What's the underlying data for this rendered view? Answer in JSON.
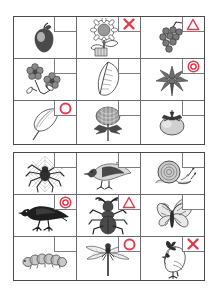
{
  "worksheet": {
    "title": "Nature picture grid worksheet",
    "grids": [
      {
        "name": "plants-grid",
        "rows": [
          [
            {
              "item": "apple",
              "label": "Apple",
              "mark": "none"
            },
            {
              "item": "sunflower",
              "label": "Sunflower",
              "mark": "x"
            },
            {
              "item": "grapes",
              "label": "Grapes",
              "mark": "triangle"
            }
          ],
          [
            {
              "item": "flower-cluster",
              "label": "Flower cluster",
              "mark": "none"
            },
            {
              "item": "leaf",
              "label": "Leaf",
              "mark": "none"
            },
            {
              "item": "maple-leaf",
              "label": "Maple leaf",
              "mark": "double-circle"
            }
          ],
          [
            {
              "item": "ginkgo-leaf",
              "label": "Ginkgo leaf",
              "mark": "circle"
            },
            {
              "item": "chrysanthemum",
              "label": "Chrysanthemum",
              "mark": "none"
            },
            {
              "item": "persimmon",
              "label": "Persimmon",
              "mark": "none"
            }
          ]
        ]
      },
      {
        "name": "animals-grid",
        "rows": [
          [
            {
              "item": "spider-web",
              "label": "Spider on web",
              "mark": "none"
            },
            {
              "item": "pigeon",
              "label": "Pigeon",
              "mark": "none"
            },
            {
              "item": "snail",
              "label": "Snail",
              "mark": "none"
            }
          ],
          [
            {
              "item": "crow",
              "label": "Crow",
              "mark": "double-circle"
            },
            {
              "item": "stag-beetle",
              "label": "Stag beetle",
              "mark": "triangle"
            },
            {
              "item": "butterfly",
              "label": "Butterfly",
              "mark": "none"
            }
          ],
          [
            {
              "item": "caterpillar",
              "label": "Caterpillar",
              "mark": "none"
            },
            {
              "item": "dragonfly",
              "label": "Dragonfly",
              "mark": "circle"
            },
            {
              "item": "chicken",
              "label": "Chicken",
              "mark": "x"
            }
          ]
        ]
      }
    ],
    "marks": {
      "none": "",
      "x": "incorrect-x",
      "triangle": "partial-triangle",
      "circle": "correct-circle",
      "double-circle": "excellent-double-circle"
    },
    "mark_color": "#e23b4e",
    "grid_line_color": "#6b6b6b",
    "border_color": "#4a4a4a"
  }
}
